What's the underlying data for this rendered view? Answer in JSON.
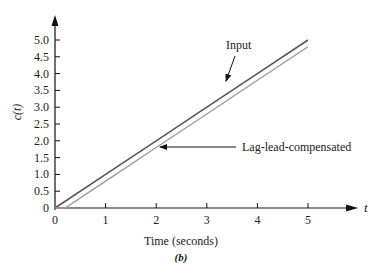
{
  "chart_data": {
    "type": "line",
    "title": "",
    "caption": "(b)",
    "xlabel": "Time (seconds)",
    "ylabel": "c(t)",
    "x_axis_end_label": "t",
    "xlim": [
      0,
      5.5
    ],
    "ylim": [
      0,
      5.0
    ],
    "x_ticks": [
      "0",
      "1",
      "2",
      "3",
      "4",
      "5"
    ],
    "y_ticks": [
      "0",
      "0.5",
      "1.0",
      "1.5",
      "2.0",
      "2.5",
      "3.0",
      "3.5",
      "4.0",
      "4.5",
      "5.0"
    ],
    "grid": false,
    "series": [
      {
        "name": "Input",
        "color": "#555555",
        "x": [
          0,
          1,
          2,
          3,
          4,
          5
        ],
        "y": [
          0,
          1.0,
          2.0,
          3.0,
          4.0,
          5.0
        ]
      },
      {
        "name": "Lag-lead-compensated",
        "color": "#999999",
        "x": [
          0,
          0.2,
          1,
          2,
          3,
          4,
          5
        ],
        "y": [
          0,
          0,
          0.8,
          1.8,
          2.8,
          3.8,
          4.8
        ]
      }
    ],
    "annotations": [
      {
        "text": "Input",
        "points_to": "Input"
      },
      {
        "text": "Lag-lead-compensated",
        "points_to": "Lag-lead-compensated"
      }
    ]
  }
}
